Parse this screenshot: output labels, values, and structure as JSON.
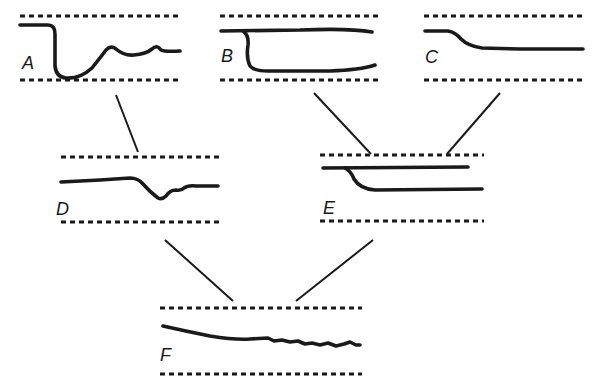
{
  "diagram": {
    "type": "tree-of-traces",
    "panels": [
      {
        "id": "A",
        "label": "A",
        "description": "trace drops sharply to bottom then recovers with oscillations"
      },
      {
        "id": "B",
        "label": "B",
        "description": "trace splits into two parallel lines (top and bottom)"
      },
      {
        "id": "C",
        "label": "C",
        "description": "trace steps down slightly and levels off"
      },
      {
        "id": "D",
        "label": "D",
        "description": "flat trace with a small dip then partial recovery"
      },
      {
        "id": "E",
        "label": "E",
        "description": "trace splits into two close parallel lines"
      },
      {
        "id": "F",
        "label": "F",
        "description": "trace slowly declines with small noise"
      }
    ],
    "edges": [
      {
        "from": "A",
        "to": "D"
      },
      {
        "from": "B",
        "to": "E"
      },
      {
        "from": "C",
        "to": "E"
      },
      {
        "from": "D",
        "to": "F"
      },
      {
        "from": "E",
        "to": "F"
      }
    ],
    "colors": {
      "ink": "#1a1a1a",
      "background": "#ffffff"
    }
  }
}
